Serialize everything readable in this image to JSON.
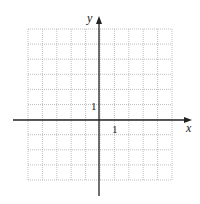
{
  "diagram": {
    "type": "coordinate-plane",
    "x_axis_label": "x",
    "y_axis_label": "y",
    "x_tick_label": "1",
    "y_tick_label": "1",
    "grid": {
      "columns": 10,
      "rows": 10,
      "x_range": [
        -5,
        5
      ],
      "y_range": [
        -4,
        6
      ],
      "line_style": "dotted",
      "line_color": "#b0b0b0"
    },
    "axis_color": "#222222"
  }
}
